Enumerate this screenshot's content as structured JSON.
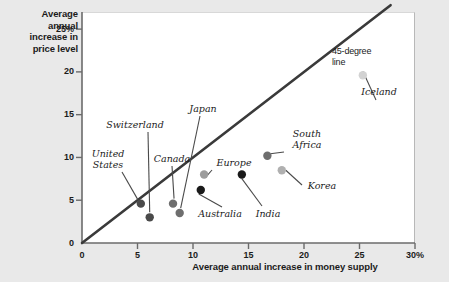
{
  "chart_data": {
    "type": "scatter",
    "title": "",
    "xlabel": "Average annual increase in money supply",
    "ylabel": "Average annual increase in price level",
    "xlim": [
      0,
      30
    ],
    "ylim": [
      0,
      27
    ],
    "grid": false,
    "legend": "none",
    "xticks": [
      "0",
      "5",
      "10",
      "15",
      "20",
      "25",
      "30%"
    ],
    "yticks": [
      "0",
      "5",
      "10",
      "15",
      "20",
      "25%"
    ],
    "xtick_values": [
      0,
      5,
      10,
      15,
      20,
      25,
      30
    ],
    "ytick_values": [
      0,
      5,
      10,
      15,
      20,
      25
    ],
    "annotations": [
      {
        "text": "45-degree\nline",
        "note": "label for the 45-degree reference line"
      }
    ],
    "reference_line": {
      "name": "45-degree line",
      "label": "45-degree\nline",
      "from": [
        0,
        0
      ],
      "to": [
        27.8,
        27.8
      ],
      "color": "#3a3a3a"
    },
    "points": [
      {
        "name": "United States",
        "label": "United\nStates",
        "x": 5.3,
        "y": 4.6,
        "color": "#4a4a4a"
      },
      {
        "name": "Switzerland",
        "label": "Switzerland",
        "x": 6.1,
        "y": 3.0,
        "color": "#4a4a4a"
      },
      {
        "name": "Canada",
        "label": "Canada",
        "x": 8.2,
        "y": 4.6,
        "color": "#6e6e6e"
      },
      {
        "name": "Japan",
        "label": "Japan",
        "x": 8.8,
        "y": 3.5,
        "color": "#6e6e6e"
      },
      {
        "name": "Australia",
        "label": "Australia",
        "x": 10.7,
        "y": 6.2,
        "color": "#1a1a1a"
      },
      {
        "name": "Europe",
        "label": "Europe",
        "x": 11.0,
        "y": 8.0,
        "color": "#9c9c9c"
      },
      {
        "name": "India",
        "label": "India",
        "x": 14.4,
        "y": 8.0,
        "color": "#1a1a1a"
      },
      {
        "name": "South Africa",
        "label": "South\nAfrica",
        "x": 16.7,
        "y": 10.2,
        "color": "#6e6e6e"
      },
      {
        "name": "Korea",
        "label": "Korea",
        "x": 18.0,
        "y": 8.5,
        "color": "#b0b0b0"
      },
      {
        "name": "Iceland",
        "label": "Iceland",
        "x": 25.3,
        "y": 19.6,
        "color": "#d2d2d2"
      }
    ]
  },
  "colors": {
    "page_background": "#e9e9e9",
    "plot_background": "#ffffff",
    "axis": "#6b6b6b",
    "line": "#3a3a3a",
    "text": "#1b1b1b"
  }
}
